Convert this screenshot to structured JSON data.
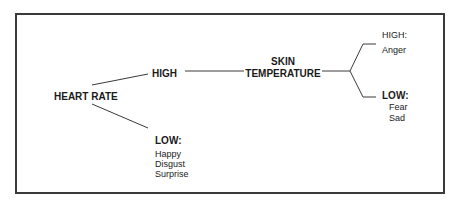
{
  "diagram": {
    "type": "decision-tree",
    "root": {
      "label": "HEART RATE"
    },
    "heart_rate_high": {
      "label": "HIGH"
    },
    "heart_rate_low": {
      "label": "LOW:",
      "emotions": [
        "Happy",
        "Disgust",
        "Surprise"
      ]
    },
    "skin_temperature": {
      "label_line1": "SKIN",
      "label_line2": "TEMPERATURE"
    },
    "skin_high": {
      "label": "HIGH:",
      "emotions": [
        "Anger"
      ]
    },
    "skin_low": {
      "label": "LOW:",
      "emotions": [
        "Fear",
        "Sad"
      ]
    },
    "colors": {
      "line": "#3a3a3a",
      "text": "#1a1a1a",
      "background": "#ffffff"
    }
  }
}
